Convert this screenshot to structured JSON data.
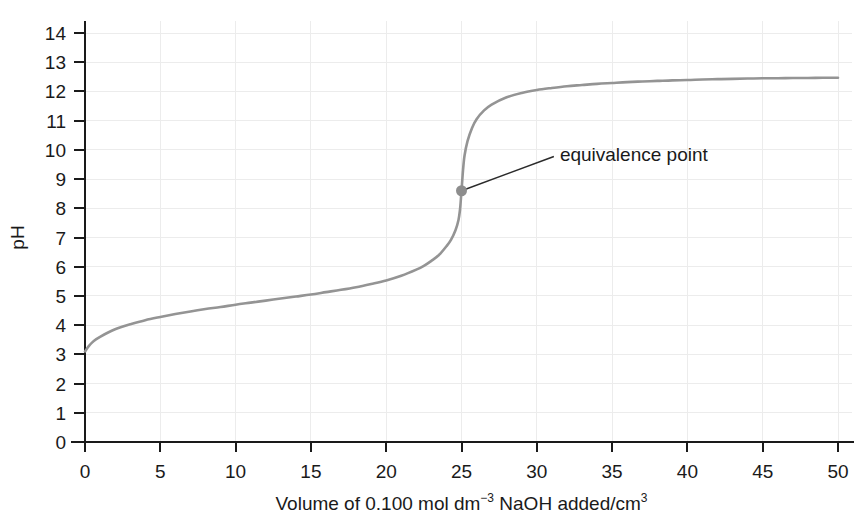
{
  "chart_data": {
    "type": "line",
    "title": "",
    "xlabel": "Volume of 0.100 mol dm-3 NaOH added/cm3",
    "xlabel_parts": {
      "before": "Volume of 0.100 mol dm",
      "sup1": "−3",
      "middle": " NaOH added/cm",
      "sup2": "3"
    },
    "ylabel": "pH",
    "xlim": [
      0,
      50
    ],
    "ylim": [
      0,
      14
    ],
    "xticks": [
      0,
      5,
      10,
      15,
      20,
      25,
      30,
      35,
      40,
      45,
      50
    ],
    "yticks": [
      0,
      1,
      2,
      3,
      4,
      5,
      6,
      7,
      8,
      9,
      10,
      11,
      12,
      13,
      14
    ],
    "grid": true,
    "legend": "none",
    "curve_color": "#949494",
    "axis_color": "#1a1a1a",
    "grid_color": "#ececec",
    "annotations": [
      {
        "label": "equivalence point",
        "point_x": 25.0,
        "point_y": 8.6,
        "text_x": 31.4,
        "text_y": 9.5
      }
    ],
    "series": [
      {
        "name": "Titration of weak acid with 0.100 mol dm-3 NaOH",
        "x": [
          0,
          0.25,
          0.5,
          0.75,
          1,
          1.5,
          2,
          2.5,
          3,
          4,
          5,
          6,
          7,
          8,
          9,
          10,
          11,
          12,
          13,
          14,
          15,
          16,
          17,
          18,
          19,
          20,
          21,
          22,
          22.5,
          23,
          23.5,
          24,
          24.3,
          24.6,
          24.8,
          24.9,
          24.95,
          25,
          25.05,
          25.1,
          25.2,
          25.4,
          25.7,
          26,
          26.5,
          27,
          28,
          29,
          30,
          31,
          32,
          33,
          34,
          35,
          36,
          37,
          38,
          39,
          40,
          41,
          42,
          43,
          44,
          45,
          46,
          47,
          48,
          49,
          50
        ],
        "y": [
          3.1,
          3.28,
          3.42,
          3.52,
          3.6,
          3.74,
          3.86,
          3.95,
          4.03,
          4.17,
          4.28,
          4.38,
          4.47,
          4.55,
          4.62,
          4.7,
          4.77,
          4.84,
          4.91,
          4.98,
          5.05,
          5.13,
          5.21,
          5.3,
          5.41,
          5.53,
          5.69,
          5.9,
          6.03,
          6.2,
          6.4,
          6.7,
          6.92,
          7.25,
          7.6,
          7.95,
          8.25,
          8.6,
          8.95,
          9.3,
          9.8,
          10.3,
          10.75,
          11.05,
          11.35,
          11.55,
          11.8,
          11.95,
          12.05,
          12.12,
          12.18,
          12.22,
          12.26,
          12.29,
          12.32,
          12.34,
          12.36,
          12.38,
          12.39,
          12.41,
          12.42,
          12.43,
          12.44,
          12.45,
          12.45,
          12.46,
          12.46,
          12.47,
          12.47
        ]
      }
    ]
  },
  "axes": {
    "y_label": "pH",
    "x_tick_labels": [
      "0",
      "5",
      "10",
      "15",
      "20",
      "25",
      "30",
      "35",
      "40",
      "45",
      "50"
    ],
    "y_tick_labels": [
      "0",
      "1",
      "2",
      "3",
      "4",
      "5",
      "6",
      "7",
      "8",
      "9",
      "10",
      "11",
      "12",
      "13",
      "14"
    ]
  },
  "annotation": {
    "equivalence_label": "equivalence point"
  }
}
